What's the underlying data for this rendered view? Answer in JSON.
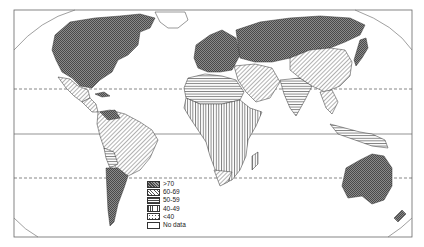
{
  "map": {
    "title": "",
    "projection": "world-equal-area-framed",
    "reference_lines": [
      {
        "name": "Tropic of Cancer",
        "style": "dashed"
      },
      {
        "name": "Equator",
        "style": "solid"
      },
      {
        "name": "Tropic of Capricorn",
        "style": "dashed"
      }
    ],
    "colors": {
      "ink": "#3a3a3a",
      "dark_fill": "#6f6f6f",
      "paper": "#ffffff"
    }
  },
  "legend": {
    "items": [
      {
        "label": ">70",
        "pattern": "cross-dense"
      },
      {
        "label": "60-69",
        "pattern": "diagonal"
      },
      {
        "label": "50-59",
        "pattern": "horizontal"
      },
      {
        "label": "40-49",
        "pattern": "vertical"
      },
      {
        "label": "<40",
        "pattern": "dotted"
      },
      {
        "label": "No data",
        "pattern": "blank"
      }
    ]
  },
  "regions": [
    {
      "name": "North America",
      "class": ">70"
    },
    {
      "name": "Mexico",
      "class": "60-69"
    },
    {
      "name": "South America (north/east)",
      "class": "60-69"
    },
    {
      "name": "Bolivia",
      "class": "50-59"
    },
    {
      "name": "Southern Cone",
      "class": ">70"
    },
    {
      "name": "Europe",
      "class": ">70"
    },
    {
      "name": "USSR",
      "class": ">70"
    },
    {
      "name": "China",
      "class": "60-69"
    },
    {
      "name": "Middle East",
      "class": "60-69"
    },
    {
      "name": "North Africa",
      "class": "50-59"
    },
    {
      "name": "Sub-Saharan Africa",
      "class": "40-49"
    },
    {
      "name": "India",
      "class": "50-59"
    },
    {
      "name": "Southeast Asia",
      "class": "60-69"
    },
    {
      "name": "Japan",
      "class": ">70"
    },
    {
      "name": "Australia",
      "class": ">70"
    },
    {
      "name": "New Zealand",
      "class": ">70"
    },
    {
      "name": "Greenland",
      "class": "No data"
    }
  ]
}
